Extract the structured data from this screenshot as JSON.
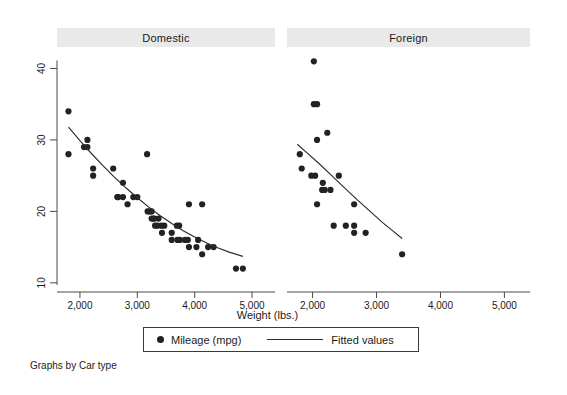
{
  "figure": {
    "note": "Graphs by Car type",
    "background": "#ffffff",
    "panel_header_color": "#e9e9e9",
    "marker_color": "#222222",
    "line_color": "#2b2b2b"
  },
  "axis": {
    "x_title": "Weight (lbs.)",
    "x_ticks": [
      "2,000",
      "3,000",
      "4,000",
      "5,000"
    ],
    "y_ticks": [
      "10",
      "20",
      "30",
      "40"
    ]
  },
  "legend": {
    "marker_label": "Mileage (mpg)",
    "line_label": "Fitted values"
  },
  "panels": [
    {
      "key": "domestic",
      "title": "Domestic"
    },
    {
      "key": "foreign",
      "title": "Foreign"
    }
  ],
  "chart_data": {
    "type": "scatter",
    "title": "",
    "subtitle": "",
    "xlabel": "Weight (lbs.)",
    "ylabel": "",
    "xlim": [
      1600,
      5400
    ],
    "ylim": [
      9,
      43
    ],
    "xticks": [
      2000,
      3000,
      4000,
      5000
    ],
    "yticks": [
      10,
      20,
      30,
      40
    ],
    "grid": false,
    "legend_position": "bottom-center",
    "legend_entries": [
      "Mileage (mpg)",
      "Fitted values"
    ],
    "note": "Graphs by Car type",
    "facet_variable": "Car type",
    "panels": [
      {
        "name": "Domestic",
        "series": [
          {
            "name": "Mileage (mpg)",
            "type": "scatter",
            "points": [
              [
                1800,
                34
              ],
              [
                1800,
                28
              ],
              [
                2070,
                29
              ],
              [
                2130,
                30
              ],
              [
                2130,
                29
              ],
              [
                2230,
                26
              ],
              [
                2230,
                25
              ],
              [
                2580,
                26
              ],
              [
                2650,
                22
              ],
              [
                2670,
                22
              ],
              [
                2750,
                24
              ],
              [
                2750,
                22
              ],
              [
                2830,
                21
              ],
              [
                2930,
                22
              ],
              [
                3000,
                22
              ],
              [
                3170,
                28
              ],
              [
                3180,
                20
              ],
              [
                3220,
                20
              ],
              [
                3250,
                20
              ],
              [
                3250,
                19
              ],
              [
                3280,
                19
              ],
              [
                3300,
                19
              ],
              [
                3310,
                18
              ],
              [
                3350,
                18
              ],
              [
                3370,
                19
              ],
              [
                3420,
                18
              ],
              [
                3430,
                17
              ],
              [
                3470,
                18
              ],
              [
                3600,
                17
              ],
              [
                3600,
                16
              ],
              [
                3690,
                18
              ],
              [
                3700,
                16
              ],
              [
                3730,
                18
              ],
              [
                3740,
                16
              ],
              [
                3830,
                16
              ],
              [
                3880,
                16
              ],
              [
                3900,
                15
              ],
              [
                3900,
                21
              ],
              [
                4030,
                15
              ],
              [
                4060,
                16
              ],
              [
                4130,
                14
              ],
              [
                4130,
                21
              ],
              [
                4234,
                15
              ],
              [
                4330,
                15
              ],
              [
                4720,
                12
              ],
              [
                4840,
                12
              ]
            ]
          },
          {
            "name": "Fitted values",
            "type": "line",
            "points": [
              [
                1800,
                31.8
              ],
              [
                2000,
                29.9
              ],
              [
                2200,
                28.1
              ],
              [
                2400,
                26.4
              ],
              [
                2600,
                24.8
              ],
              [
                2800,
                23.3
              ],
              [
                3000,
                21.9
              ],
              [
                3200,
                20.6
              ],
              [
                3400,
                19.4
              ],
              [
                3600,
                18.3
              ],
              [
                3800,
                17.3
              ],
              [
                4000,
                16.4
              ],
              [
                4200,
                15.6
              ],
              [
                4400,
                14.9
              ],
              [
                4600,
                14.3
              ],
              [
                4840,
                13.7
              ]
            ]
          }
        ]
      },
      {
        "name": "Foreign",
        "series": [
          {
            "name": "Mileage (mpg)",
            "type": "scatter",
            "points": [
              [
                2020,
                41
              ],
              [
                2020,
                35
              ],
              [
                2070,
                35
              ],
              [
                2230,
                31
              ],
              [
                2070,
                30
              ],
              [
                1800,
                28
              ],
              [
                1830,
                26
              ],
              [
                1980,
                25
              ],
              [
                2040,
                25
              ],
              [
                2160,
                24
              ],
              [
                2150,
                23
              ],
              [
                2190,
                23
              ],
              [
                2280,
                23
              ],
              [
                2410,
                25
              ],
              [
                2070,
                21
              ],
              [
                2650,
                21
              ],
              [
                2330,
                18
              ],
              [
                2520,
                18
              ],
              [
                2650,
                17
              ],
              [
                2830,
                17
              ],
              [
                2650,
                18
              ],
              [
                3400,
                14
              ]
            ]
          },
          {
            "name": "Fitted values",
            "type": "line",
            "points": [
              [
                1760,
                29.4
              ],
              [
                1900,
                28.3
              ],
              [
                2100,
                26.7
              ],
              [
                2300,
                25.0
              ],
              [
                2500,
                23.3
              ],
              [
                2700,
                21.6
              ],
              [
                2900,
                20.0
              ],
              [
                3100,
                18.4
              ],
              [
                3250,
                17.3
              ],
              [
                3400,
                16.2
              ]
            ]
          }
        ]
      }
    ]
  }
}
